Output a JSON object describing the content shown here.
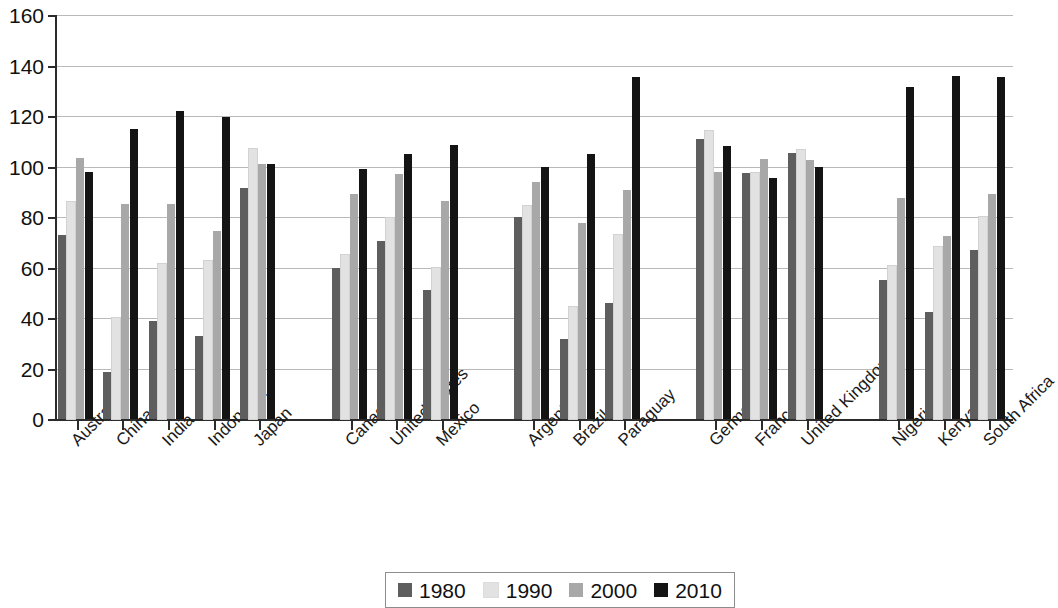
{
  "chart_data": {
    "type": "bar",
    "title": "",
    "subtitle": "",
    "xlabel": "",
    "ylabel": "",
    "ylim": [
      0,
      160
    ],
    "ytick_step": 20,
    "ytick_labels": [
      "0",
      "20",
      "40",
      "60",
      "80",
      "100",
      "120",
      "140",
      "160"
    ],
    "grid": true,
    "legend_position": "bottom",
    "categories": [
      "Australia",
      "China",
      "India",
      "Indonesia",
      "Japan",
      "Canada",
      "United States",
      "Mexico",
      "Argentina",
      "Brazil",
      "Paraguay",
      "Germany",
      "France",
      "United Kingdom",
      "Nigeria",
      "Kenya",
      "South Africa"
    ],
    "group_breaks_after": [
      "Japan",
      "Mexico",
      "Paraguay",
      "United Kingdom"
    ],
    "series": [
      {
        "name": "1980",
        "color": "#5e5e5e",
        "values": [
          73,
          18.5,
          39,
          33,
          91.5,
          60,
          70.5,
          51,
          80,
          31.5,
          46,
          111,
          97.5,
          105.5,
          55,
          42.5,
          67
        ]
      },
      {
        "name": "1990",
        "color": "#e2e2e2",
        "values": [
          86,
          40,
          61.5,
          62.5,
          107,
          65,
          79.5,
          60,
          84.5,
          44.5,
          73,
          114,
          97.5,
          106.5,
          60.5,
          68,
          80
        ]
      },
      {
        "name": "2000",
        "color": "#a8a8a8",
        "values": [
          103.5,
          85,
          85,
          74.5,
          101,
          89,
          97,
          86.5,
          94,
          77.5,
          90.5,
          98,
          103,
          102.5,
          87.5,
          72.5,
          89
        ]
      },
      {
        "name": "2010",
        "color": "#141414",
        "values": [
          98,
          115,
          122,
          119.5,
          101,
          99,
          105,
          108.5,
          100,
          105,
          135.5,
          108,
          95.5,
          100,
          131.5,
          136,
          135.5
        ]
      }
    ]
  },
  "legend": {
    "entries": [
      {
        "label": "1980",
        "color": "#5e5e5e"
      },
      {
        "label": "1990",
        "color": "#e2e2e2"
      },
      {
        "label": "2000",
        "color": "#a8a8a8"
      },
      {
        "label": "2010",
        "color": "#141414"
      }
    ]
  },
  "colors": {
    "axis": "#2b2b2b",
    "grid": "#b9b9b9",
    "text": "#111111",
    "background": "#ffffff"
  }
}
